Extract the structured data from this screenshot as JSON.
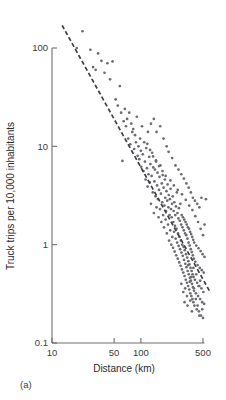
{
  "caption": {
    "label": "(a)"
  },
  "chart_data": {
    "type": "scatter",
    "title": "",
    "subtitle": "",
    "xlabel": "Distance (km)",
    "ylabel": "Truck trips per 10,000 inhabitants",
    "xscale": "log",
    "yscale": "log",
    "xlim": [
      10,
      600
    ],
    "ylim": [
      0.1,
      200
    ],
    "grid": false,
    "legend": null,
    "xticks": [
      10,
      50,
      100,
      500
    ],
    "xticklabels": [
      "10",
      "50",
      "100",
      "500"
    ],
    "yticks": [
      0.1,
      1,
      10,
      100
    ],
    "yticklabels": [
      "0.1",
      "1",
      "10",
      "100"
    ],
    "annotations": [
      {
        "type": "trendline",
        "style": "dashed",
        "description": "Fitted power-law decline of truck trips with distance",
        "x": [
          13,
          600
        ],
        "y": [
          170,
          0.33
        ]
      }
    ],
    "series": [
      {
        "name": "Truck trips vs distance",
        "marker": "dot",
        "color": "#6b6b70",
        "points": [
          [
            19,
            100
          ],
          [
            22,
            148
          ],
          [
            27,
            96
          ],
          [
            29,
            64
          ],
          [
            31,
            60
          ],
          [
            33,
            88
          ],
          [
            36,
            74
          ],
          [
            39,
            56
          ],
          [
            42,
            70
          ],
          [
            45,
            48
          ],
          [
            48,
            73
          ],
          [
            52,
            30
          ],
          [
            55,
            26
          ],
          [
            58,
            41
          ],
          [
            60,
            22
          ],
          [
            62,
            7.1
          ],
          [
            64,
            18
          ],
          [
            66,
            24
          ],
          [
            68,
            16
          ],
          [
            70,
            19
          ],
          [
            72,
            12
          ],
          [
            74,
            22
          ],
          [
            76,
            10.5
          ],
          [
            78,
            17
          ],
          [
            80,
            14
          ],
          [
            82,
            15
          ],
          [
            84,
            9.4
          ],
          [
            86,
            13
          ],
          [
            88,
            11
          ],
          [
            90,
            20
          ],
          [
            92,
            8.0
          ],
          [
            94,
            10
          ],
          [
            96,
            7.4
          ],
          [
            98,
            12
          ],
          [
            100,
            9.0
          ],
          [
            101,
            6.2
          ],
          [
            103,
            16
          ],
          [
            105,
            8.3
          ],
          [
            107,
            5.6
          ],
          [
            109,
            11
          ],
          [
            111,
            7.0
          ],
          [
            113,
            4.6
          ],
          [
            115,
            9.6
          ],
          [
            117,
            6.0
          ],
          [
            119,
            3.9
          ],
          [
            120,
            14
          ],
          [
            122,
            5.2
          ],
          [
            124,
            7.8
          ],
          [
            126,
            4.3
          ],
          [
            128,
            6.6
          ],
          [
            130,
            2.6
          ],
          [
            132,
            5.0
          ],
          [
            134,
            8.6
          ],
          [
            136,
            3.4
          ],
          [
            138,
            6.1
          ],
          [
            140,
            2.1
          ],
          [
            142,
            4.4
          ],
          [
            144,
            5.8
          ],
          [
            146,
            3.1
          ],
          [
            148,
            7.2
          ],
          [
            150,
            2.4
          ],
          [
            152,
            4.0
          ],
          [
            154,
            5.4
          ],
          [
            156,
            2.9
          ],
          [
            158,
            1.9
          ],
          [
            160,
            3.6
          ],
          [
            162,
            4.9
          ],
          [
            164,
            2.3
          ],
          [
            166,
            6.4
          ],
          [
            168,
            3.3
          ],
          [
            170,
            1.7
          ],
          [
            172,
            4.2
          ],
          [
            174,
            2.7
          ],
          [
            176,
            5.1
          ],
          [
            178,
            2.0
          ],
          [
            180,
            3.8
          ],
          [
            182,
            1.5
          ],
          [
            184,
            2.5
          ],
          [
            186,
            4.6
          ],
          [
            188,
            3.0
          ],
          [
            190,
            1.8
          ],
          [
            192,
            2.2
          ],
          [
            194,
            3.5
          ],
          [
            196,
            1.3
          ],
          [
            198,
            2.8
          ],
          [
            200,
            4.1
          ],
          [
            202,
            1.6
          ],
          [
            204,
            2.4
          ],
          [
            206,
            3.2
          ],
          [
            208,
            1.1
          ],
          [
            210,
            2.0
          ],
          [
            212,
            2.9
          ],
          [
            214,
            1.4
          ],
          [
            216,
            3.7
          ],
          [
            218,
            2.3
          ],
          [
            220,
            1.0
          ],
          [
            222,
            1.9
          ],
          [
            224,
            2.6
          ],
          [
            226,
            1.2
          ],
          [
            228,
            3.1
          ],
          [
            230,
            0.93
          ],
          [
            232,
            1.7
          ],
          [
            234,
            2.2
          ],
          [
            236,
            1.35
          ],
          [
            238,
            2.7
          ],
          [
            240,
            0.85
          ],
          [
            242,
            1.55
          ],
          [
            244,
            2.0
          ],
          [
            246,
            1.15
          ],
          [
            248,
            2.45
          ],
          [
            250,
            0.78
          ],
          [
            252,
            1.45
          ],
          [
            254,
            3.4
          ],
          [
            256,
            1.05
          ],
          [
            258,
            2.1
          ],
          [
            260,
            0.72
          ],
          [
            262,
            1.3
          ],
          [
            264,
            1.85
          ],
          [
            266,
            0.97
          ],
          [
            268,
            2.35
          ],
          [
            270,
            0.66
          ],
          [
            272,
            1.2
          ],
          [
            274,
            1.75
          ],
          [
            276,
            0.9
          ],
          [
            278,
            2.6
          ],
          [
            280,
            0.61
          ],
          [
            282,
            1.1
          ],
          [
            284,
            1.6
          ],
          [
            286,
            0.83
          ],
          [
            288,
            2.0
          ],
          [
            290,
            0.56
          ],
          [
            292,
            1.0
          ],
          [
            294,
            1.5
          ],
          [
            296,
            0.77
          ],
          [
            298,
            1.9
          ],
          [
            300,
            0.52
          ],
          [
            302,
            0.95
          ],
          [
            304,
            1.4
          ],
          [
            306,
            0.7
          ],
          [
            308,
            1.8
          ],
          [
            310,
            0.48
          ],
          [
            312,
            0.88
          ],
          [
            314,
            1.3
          ],
          [
            316,
            0.64
          ],
          [
            318,
            1.7
          ],
          [
            320,
            0.44
          ],
          [
            322,
            0.8
          ],
          [
            324,
            1.25
          ],
          [
            326,
            0.59
          ],
          [
            328,
            1.6
          ],
          [
            330,
            0.41
          ],
          [
            332,
            0.74
          ],
          [
            334,
            1.15
          ],
          [
            336,
            0.54
          ],
          [
            338,
            1.5
          ],
          [
            340,
            0.38
          ],
          [
            342,
            0.68
          ],
          [
            344,
            1.05
          ],
          [
            346,
            0.5
          ],
          [
            348,
            1.45
          ],
          [
            350,
            0.35
          ],
          [
            352,
            0.63
          ],
          [
            354,
            0.98
          ],
          [
            356,
            0.46
          ],
          [
            358,
            1.35
          ],
          [
            360,
            0.32
          ],
          [
            362,
            0.58
          ],
          [
            364,
            0.9
          ],
          [
            366,
            0.43
          ],
          [
            368,
            1.28
          ],
          [
            370,
            0.3
          ],
          [
            372,
            0.54
          ],
          [
            374,
            0.84
          ],
          [
            376,
            0.4
          ],
          [
            378,
            1.2
          ],
          [
            380,
            0.28
          ],
          [
            382,
            0.5
          ],
          [
            384,
            0.78
          ],
          [
            386,
            0.37
          ],
          [
            388,
            1.12
          ],
          [
            390,
            0.26
          ],
          [
            392,
            0.47
          ],
          [
            394,
            0.72
          ],
          [
            396,
            0.34
          ],
          [
            398,
            1.05
          ],
          [
            400,
            0.24
          ],
          [
            405,
            0.44
          ],
          [
            410,
            0.67
          ],
          [
            415,
            0.32
          ],
          [
            420,
            0.98
          ],
          [
            425,
            0.22
          ],
          [
            430,
            0.41
          ],
          [
            435,
            0.62
          ],
          [
            440,
            0.3
          ],
          [
            445,
            0.92
          ],
          [
            450,
            0.21
          ],
          [
            455,
            0.38
          ],
          [
            460,
            0.58
          ],
          [
            465,
            0.28
          ],
          [
            470,
            0.86
          ],
          [
            475,
            0.19
          ],
          [
            480,
            0.36
          ],
          [
            485,
            0.55
          ],
          [
            490,
            0.26
          ],
          [
            495,
            0.8
          ],
          [
            500,
            0.18
          ],
          [
            505,
            0.33
          ],
          [
            510,
            0.52
          ],
          [
            515,
            0.25
          ],
          [
            520,
            0.75
          ],
          [
            130,
            17
          ],
          [
            140,
            19
          ],
          [
            150,
            14
          ],
          [
            165,
            16
          ],
          [
            180,
            12
          ],
          [
            195,
            10
          ],
          [
            205,
            8.8
          ],
          [
            225,
            7.6
          ],
          [
            245,
            6.4
          ],
          [
            265,
            5.8
          ],
          [
            285,
            5.2
          ],
          [
            305,
            4.7
          ],
          [
            325,
            4.2
          ],
          [
            345,
            3.8
          ],
          [
            365,
            3.4
          ],
          [
            385,
            3.0
          ],
          [
            405,
            2.8
          ],
          [
            430,
            2.6
          ],
          [
            455,
            2.4
          ],
          [
            480,
            3.0
          ],
          [
            540,
            2.9
          ],
          [
            520,
            1.6
          ],
          [
            500,
            1.25
          ],
          [
            470,
            1.45
          ],
          [
            440,
            1.7
          ],
          [
            410,
            1.95
          ],
          [
            380,
            2.25
          ],
          [
            350,
            2.5
          ],
          [
            320,
            2.85
          ],
          [
            290,
            3.25
          ],
          [
            260,
            3.6
          ],
          [
            235,
            4.0
          ],
          [
            215,
            4.5
          ],
          [
            190,
            5.0
          ],
          [
            175,
            5.6
          ],
          [
            160,
            6.3
          ],
          [
            148,
            7.0
          ],
          [
            137,
            7.9
          ],
          [
            127,
            9.2
          ],
          [
            118,
            10.6
          ],
          [
            340,
            0.62
          ],
          [
            355,
            0.42
          ],
          [
            370,
            0.47
          ],
          [
            390,
            0.58
          ],
          [
            300,
            0.33
          ],
          [
            315,
            0.36
          ],
          [
            285,
            0.4
          ],
          [
            330,
            0.3
          ],
          [
            360,
            0.27
          ],
          [
            420,
            0.5
          ],
          [
            395,
            0.36
          ],
          [
            445,
            0.38
          ],
          [
            465,
            0.43
          ],
          [
            335,
            0.24
          ],
          [
            310,
            0.26
          ],
          [
            375,
            0.21
          ],
          [
            415,
            0.28
          ],
          [
            435,
            0.24
          ],
          [
            455,
            0.19
          ],
          [
            490,
            0.22
          ]
        ]
      }
    ]
  }
}
